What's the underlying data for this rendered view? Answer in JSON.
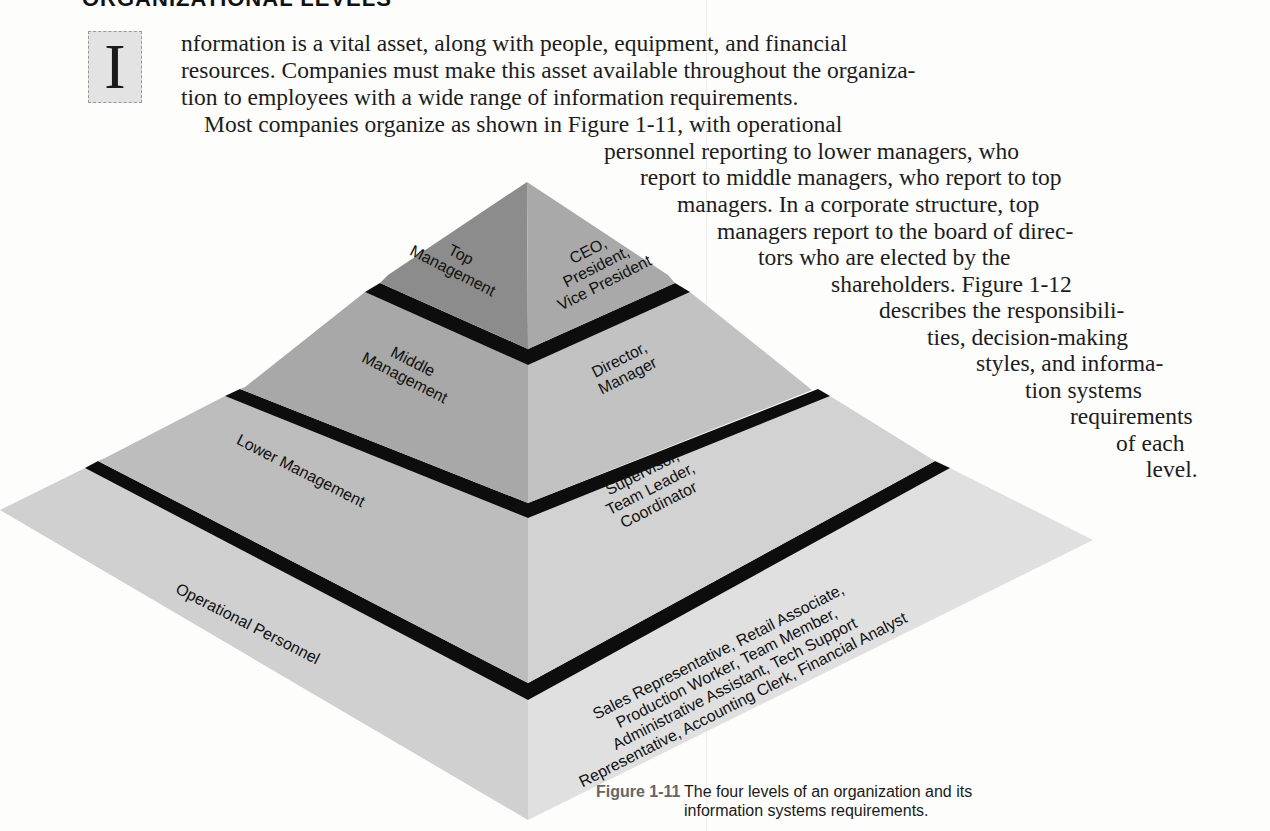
{
  "section": {
    "heading": "ORGANIZATIONAL LEVELS"
  },
  "body": {
    "drop_cap": "I",
    "lines": [
      "nformation is a vital asset, along with people, equipment, and financial",
      "resources. Companies must make this asset available throughout the organiza-",
      "tion to employees with a wide range of information requirements.",
      "Most companies organize as shown in Figure 1-11, with operational",
      "personnel reporting to lower managers, who",
      "report to middle managers, who report to top",
      "managers. In a corporate structure, top",
      "managers report to the board of direc-",
      "tors who are elected by the",
      "shareholders. Figure 1-12",
      "describes the responsibili-",
      "ties, decision-making",
      "styles, and informa-",
      "tion systems",
      "requirements",
      "of each",
      "level."
    ]
  },
  "figure": {
    "levels": [
      {
        "level": "Top Management",
        "left_lines": [
          "Top",
          "Management"
        ],
        "right_lines": [
          "CEO,",
          "President,",
          "Vice President"
        ]
      },
      {
        "level": "Middle Management",
        "left_lines": [
          "Middle",
          "Management"
        ],
        "right_lines": [
          "Director,",
          "Manager"
        ]
      },
      {
        "level": "Lower Management",
        "left_lines": [
          "Lower Management"
        ],
        "right_lines": [
          "Supervisor,",
          "Team Leader,",
          "Coordinator"
        ]
      },
      {
        "level": "Operational Personnel",
        "left_lines": [
          "Operational Personnel"
        ],
        "right_lines": [
          "Sales Representative, Retail Associate,",
          "Production Worker, Team Member,",
          "Administrative Assistant, Tech Support",
          "Representative, Accounting Clerk, Financial Analyst"
        ]
      }
    ],
    "colors": {
      "top_left": "#8c8c8c",
      "top_right": "#a9a9a9",
      "middle_left": "#a8a8a8",
      "middle_right": "#c2c2c2",
      "lower_left": "#bdbdbd",
      "lower_right": "#d2d2d2",
      "base_left": "#d0d0d0",
      "base_right": "#e0e0e0",
      "band": "#0d0d0d"
    },
    "caption_number": "Figure 1-11",
    "caption_text": "The four levels of an organization and its information systems requirements."
  }
}
